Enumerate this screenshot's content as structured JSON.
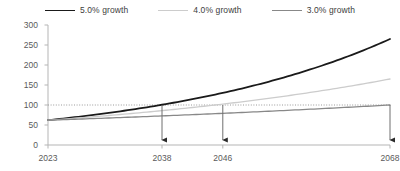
{
  "chart_data": {
    "type": "line",
    "title": "",
    "xlabel": "",
    "ylabel": "",
    "xlim": [
      2023,
      2068
    ],
    "ylim": [
      0,
      300
    ],
    "grid": false,
    "legend_position": "top-center",
    "y_ticks": [
      0,
      50,
      100,
      150,
      200,
      250,
      300
    ],
    "x_ticks": [
      2023,
      2038,
      2046,
      2068
    ],
    "x_tick_labels": [
      "2023",
      "2038",
      "2046",
      "2068"
    ],
    "x": [
      2023,
      2028,
      2033,
      2038,
      2043,
      2046,
      2048,
      2053,
      2058,
      2063,
      2068
    ],
    "series": [
      {
        "name": "5.0% growth",
        "color": "#1a1a1a",
        "values": [
          62,
          79,
          101,
          129,
          165,
          186,
          200,
          255,
          285,
          300,
          265
        ]
      },
      {
        "name": "4.0% growth",
        "color": "#cccccc",
        "values": [
          62,
          75,
          92,
          112,
          136,
          153,
          165,
          200,
          244,
          297,
          165
        ]
      },
      {
        "name": "3.0% growth",
        "color": "#888888",
        "values": [
          62,
          72,
          83,
          97,
          112,
          122,
          130,
          150,
          174,
          202,
          100
        ]
      }
    ],
    "reference_line": {
      "name": "baseline-100",
      "value": 100,
      "style": "dotted",
      "color": "#9a9a9a"
    },
    "annotations": [
      {
        "name": "arrow-2038",
        "x": 2038,
        "from_y": 100,
        "to_y": 0,
        "label": ""
      },
      {
        "name": "arrow-2046",
        "x": 2046,
        "from_y": 100,
        "to_y": 0,
        "label": ""
      },
      {
        "name": "arrow-2068",
        "x": 2068,
        "from_y": 100,
        "to_y": 0,
        "label": ""
      }
    ]
  },
  "legend": {
    "items": [
      {
        "label": "5.0% growth"
      },
      {
        "label": "4.0% growth"
      },
      {
        "label": "3.0% growth"
      }
    ]
  },
  "axis": {
    "y_labels": [
      "300",
      "250",
      "200",
      "150",
      "100",
      "50",
      "0"
    ],
    "x_labels": [
      "2023",
      "2038",
      "2046",
      "2068"
    ]
  },
  "colors": {
    "series_1": "#1a1a1a",
    "series_2": "#cccccc",
    "series_3": "#888888",
    "axis": "#b5b5b5",
    "text": "#5a5a5a",
    "reference": "#9a9a9a"
  }
}
